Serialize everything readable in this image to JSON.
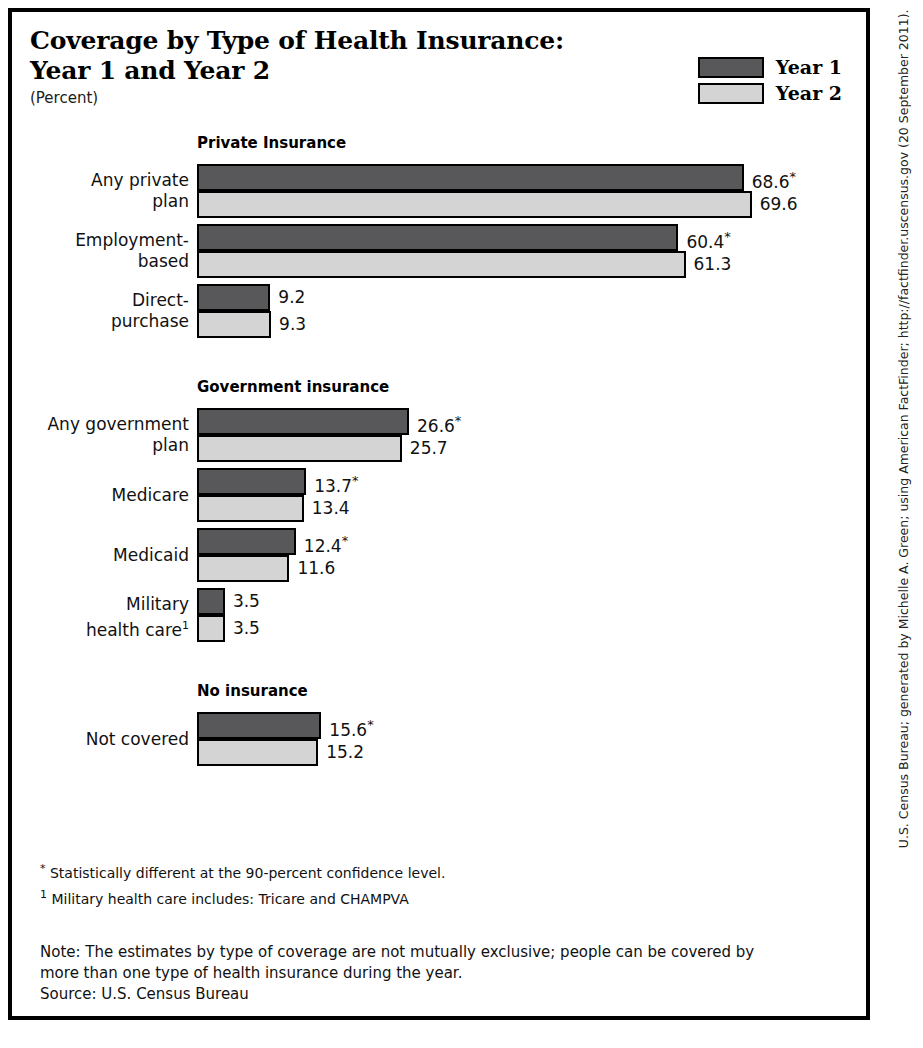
{
  "title": {
    "line1": "Coverage by Type of Health Insurance:",
    "line2": "Year 1 and Year 2",
    "subtitle": "(Percent)"
  },
  "legend": {
    "items": [
      {
        "label": "Year 1",
        "color": "#58585a",
        "swatch_name": "legend-swatch-year-1"
      },
      {
        "label": "Year 2",
        "color": "#d4d4d4",
        "swatch_name": "legend-swatch-year-2"
      }
    ]
  },
  "footnotes": [
    {
      "mark": "*",
      "text": " Statistically different at the 90-percent confidence level."
    },
    {
      "mark": "1",
      "text": " Military health care includes: Tricare and CHAMPVA"
    }
  ],
  "note": {
    "line1": "Note:  The estimates by type of coverage are not mutually exclusive; people can be covered by",
    "line2": "more than one type of health insurance during the year.",
    "line3": "Source: U.S. Census Bureau"
  },
  "credit": "U.S. Census Bureau; generated by Michelle A. Green; using American FactFinder; http://factfinder.uscensus.gov (20 September 2011).",
  "chart_data": {
    "type": "bar",
    "orientation": "horizontal",
    "title": "Coverage by Type of Health Insurance: Year 1 and Year 2",
    "subtitle": "(Percent)",
    "xlabel": "",
    "ylabel": "",
    "xlim": [
      0,
      72
    ],
    "grid": false,
    "legend_position": "top-right",
    "series": [
      {
        "name": "Year 1",
        "color": "#58585a"
      },
      {
        "name": "Year 2",
        "color": "#d4d4d4"
      }
    ],
    "sections": [
      {
        "header": "Private Insurance",
        "categories": [
          {
            "label_lines": [
              "Any private",
              "plan"
            ],
            "year1": {
              "value": 68.6,
              "display": "68.6",
              "significant": true
            },
            "year2": {
              "value": 69.6,
              "display": "69.6",
              "significant": false
            }
          },
          {
            "label_lines": [
              "Employment-",
              "based"
            ],
            "year1": {
              "value": 60.4,
              "display": "60.4",
              "significant": true
            },
            "year2": {
              "value": 61.3,
              "display": "61.3",
              "significant": false
            }
          },
          {
            "label_lines": [
              "Direct-",
              "purchase"
            ],
            "year1": {
              "value": 9.2,
              "display": "9.2",
              "significant": false
            },
            "year2": {
              "value": 9.3,
              "display": "9.3",
              "significant": false
            }
          }
        ]
      },
      {
        "header": "Government insurance",
        "categories": [
          {
            "label_lines": [
              "Any government",
              "plan"
            ],
            "year1": {
              "value": 26.6,
              "display": "26.6",
              "significant": true
            },
            "year2": {
              "value": 25.7,
              "display": "25.7",
              "significant": false
            }
          },
          {
            "label_lines": [
              "Medicare"
            ],
            "year1": {
              "value": 13.7,
              "display": "13.7",
              "significant": true
            },
            "year2": {
              "value": 13.4,
              "display": "13.4",
              "significant": false
            }
          },
          {
            "label_lines": [
              "Medicaid"
            ],
            "year1": {
              "value": 12.4,
              "display": "12.4",
              "significant": true
            },
            "year2": {
              "value": 11.6,
              "display": "11.6",
              "significant": false
            }
          },
          {
            "label_lines": [
              "Military",
              "health care¹"
            ],
            "year1": {
              "value": 3.5,
              "display": "3.5",
              "significant": false
            },
            "year2": {
              "value": 3.5,
              "display": "3.5",
              "significant": false
            }
          }
        ]
      },
      {
        "header": "No insurance",
        "categories": [
          {
            "label_lines": [
              "Not covered"
            ],
            "year1": {
              "value": 15.6,
              "display": "15.6",
              "significant": true
            },
            "year2": {
              "value": 15.2,
              "display": "15.2",
              "significant": false
            }
          }
        ]
      }
    ]
  }
}
